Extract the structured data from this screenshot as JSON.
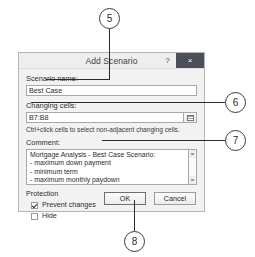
{
  "dialog": {
    "title": "Add Scenario",
    "help_label": "?",
    "close_label": "×",
    "scenario_name_label": "Scenario name:",
    "scenario_name_value": "Best Case",
    "changing_cells_label": "Changing cells:",
    "changing_cells_value": "B7:B8",
    "range_select_tooltip": "Collapse Dialog",
    "hint": "Ctrl+click cells to select non-adjacent changing cells.",
    "comment_label": "Comment:",
    "comment_lines": [
      "Mortgage Analysis - Best Case Scenario:",
      " - maximum down payment",
      " - minimum term",
      " - maximum monthly paydown"
    ],
    "protection_label": "Protection",
    "prevent_changes_label": "Prevent changes",
    "prevent_changes_checked": true,
    "hide_label": "Hide",
    "hide_checked": false,
    "ok_label": "OK",
    "cancel_label": "Cancel"
  },
  "callouts": [
    {
      "id": "5",
      "label": "5"
    },
    {
      "id": "6",
      "label": "6"
    },
    {
      "id": "7",
      "label": "7"
    },
    {
      "id": "8",
      "label": "8"
    }
  ],
  "colors": {
    "close_button": "#4a4f58",
    "dialog_bg": "#f2f2f2",
    "callout_stroke": "#3a3a3a"
  }
}
